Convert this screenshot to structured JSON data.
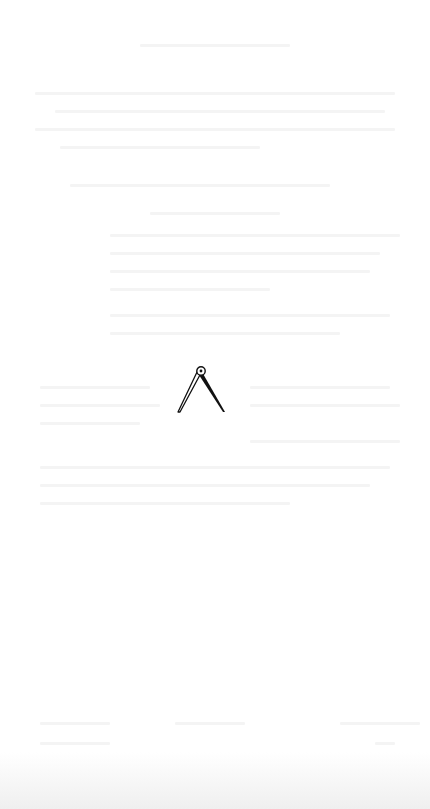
{
  "page": {
    "background": "#ffffff",
    "content": "blank page with faint mirrored bleed-through text (illegible)"
  },
  "ornament": {
    "icon": "compass-divider-icon",
    "color": "#111111"
  },
  "bleed_lines": [
    {
      "x": 140,
      "y": 44,
      "w": 150
    },
    {
      "x": 35,
      "y": 92,
      "w": 360
    },
    {
      "x": 55,
      "y": 110,
      "w": 330
    },
    {
      "x": 35,
      "y": 128,
      "w": 360
    },
    {
      "x": 60,
      "y": 146,
      "w": 200
    },
    {
      "x": 70,
      "y": 184,
      "w": 260
    },
    {
      "x": 150,
      "y": 212,
      "w": 130
    },
    {
      "x": 110,
      "y": 234,
      "w": 290
    },
    {
      "x": 110,
      "y": 252,
      "w": 270
    },
    {
      "x": 110,
      "y": 270,
      "w": 260
    },
    {
      "x": 110,
      "y": 288,
      "w": 160
    },
    {
      "x": 110,
      "y": 314,
      "w": 280
    },
    {
      "x": 110,
      "y": 332,
      "w": 230
    },
    {
      "x": 40,
      "y": 386,
      "w": 110
    },
    {
      "x": 250,
      "y": 386,
      "w": 140
    },
    {
      "x": 40,
      "y": 404,
      "w": 120
    },
    {
      "x": 250,
      "y": 404,
      "w": 150
    },
    {
      "x": 40,
      "y": 422,
      "w": 100
    },
    {
      "x": 250,
      "y": 440,
      "w": 150
    },
    {
      "x": 40,
      "y": 466,
      "w": 350
    },
    {
      "x": 40,
      "y": 484,
      "w": 330
    },
    {
      "x": 40,
      "y": 502,
      "w": 250
    },
    {
      "x": 40,
      "y": 722,
      "w": 70
    },
    {
      "x": 175,
      "y": 722,
      "w": 70
    },
    {
      "x": 340,
      "y": 722,
      "w": 80
    },
    {
      "x": 40,
      "y": 742,
      "w": 70
    },
    {
      "x": 375,
      "y": 742,
      "w": 20
    }
  ]
}
